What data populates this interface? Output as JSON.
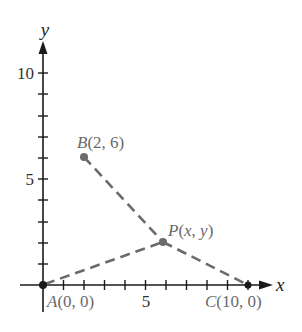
{
  "chart_data": {
    "type": "diagram",
    "title": "",
    "xlabel": "x",
    "ylabel": "y",
    "xlim": [
      0,
      11
    ],
    "ylim": [
      0,
      11
    ],
    "x_tick_labels": [
      "5"
    ],
    "y_tick_labels": [
      "5",
      "10"
    ],
    "points": [
      {
        "name": "A",
        "label": "A(0, 0)",
        "x": 0,
        "y": 0
      },
      {
        "name": "B",
        "label": "B(2, 6)",
        "x": 2,
        "y": 6
      },
      {
        "name": "C",
        "label": "C(10, 0)",
        "x": 10,
        "y": 0
      },
      {
        "name": "P",
        "label": "P(x, y)",
        "x": 5.8,
        "y": 2
      }
    ],
    "segments": [
      {
        "from": "A",
        "to": "P",
        "style": "dashed"
      },
      {
        "from": "B",
        "to": "P",
        "style": "dashed"
      },
      {
        "from": "P",
        "to": "C",
        "style": "dashed"
      }
    ]
  },
  "labels": {
    "x_axis": "x",
    "y_axis": "y",
    "x_tick_5": "5",
    "y_tick_5": "5",
    "y_tick_10": "10",
    "point_a": "A(0, 0)",
    "point_b": "B(2, 6)",
    "point_c": "C(10, 0)",
    "point_p": "P(x, y)"
  }
}
